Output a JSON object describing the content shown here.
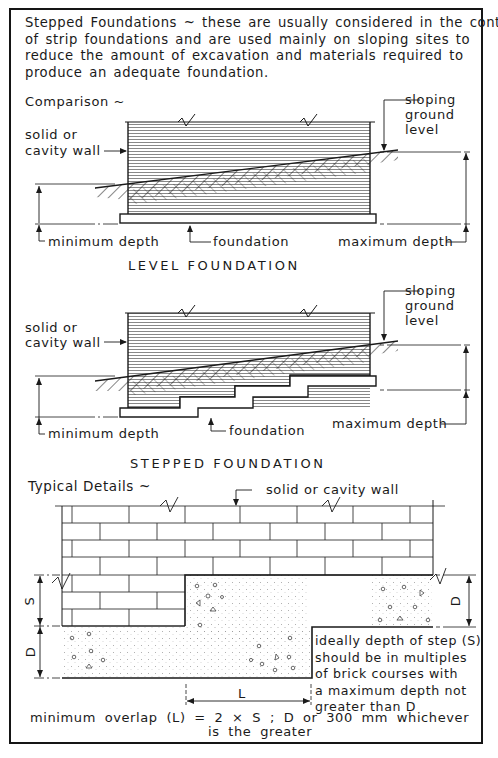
{
  "intro": {
    "lines": [
      "Stepped Foundations ~ these are usually considered in the context",
      "of strip foundations and are used mainly on sloping sites to",
      "reduce the amount of excavation and materials required to",
      "produce an adequate foundation."
    ]
  },
  "comparison": {
    "heading": "Comparison ~",
    "level": {
      "wall_label_1": "solid or",
      "wall_label_2": "cavity wall",
      "ground_label_1": "sloping",
      "ground_label_2": "ground",
      "ground_label_3": "level",
      "min_depth": "minimum depth",
      "foundation": "foundation",
      "max_depth": "maximum depth",
      "caption": "LEVEL FOUNDATION"
    },
    "stepped": {
      "wall_label_1": "solid or",
      "wall_label_2": "cavity wall",
      "ground_label_1": "sloping",
      "ground_label_2": "ground",
      "ground_label_3": "level",
      "min_depth": "minimum depth",
      "foundation": "foundation",
      "max_depth": "maximum depth",
      "caption": "STEPPED FOUNDATION"
    }
  },
  "details": {
    "heading": "Typical Details ~",
    "wall_label": "solid or cavity wall",
    "dim_s": "S",
    "dim_d_left": "D",
    "dim_d_right": "D",
    "dim_l": "L",
    "note_lines": [
      "ideally depth of step (S)",
      "should be in multiples",
      "of brick courses with",
      "a maximum depth not",
      "greater than D"
    ],
    "formula_line_1": "minimum overlap (L) = 2 × S ; D or 300 mm whichever",
    "formula_line_2": "is the greater"
  },
  "colors": {
    "ink": "#1a1a1a",
    "paper": "#ffffff"
  }
}
